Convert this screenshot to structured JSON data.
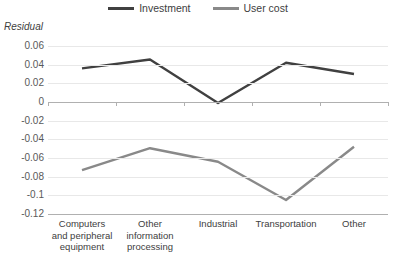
{
  "chart_data": {
    "type": "line",
    "title": "",
    "xlabel": "",
    "ylabel": "Residual",
    "categories": [
      "Computers and peripheral equipment",
      "Other information processing",
      "Industrial",
      "Transportation",
      "Other"
    ],
    "series": [
      {
        "name": "Investment",
        "color": "#404040",
        "values": [
          0.036,
          0.0455,
          -0.001,
          0.042,
          0.03
        ]
      },
      {
        "name": "User cost",
        "color": "#898989",
        "values": [
          -0.073,
          -0.0495,
          -0.064,
          -0.105,
          -0.048
        ]
      }
    ],
    "ylim": [
      -0.12,
      0.06
    ],
    "yticks": [
      0.06,
      0.04,
      0.02,
      0,
      -0.02,
      -0.04,
      -0.06,
      -0.08,
      -0.1,
      -0.12
    ],
    "ytick_labels": [
      "0.06",
      "0.04",
      "0.02",
      "0",
      "-0.02",
      "-0.04",
      "-0.06",
      "-0.08",
      "-0.1",
      "-0.12"
    ],
    "grid": true,
    "legend_position": "top"
  },
  "legend": {
    "items": [
      {
        "label": "Investment",
        "color": "#404040"
      },
      {
        "label": "User cost",
        "color": "#898989"
      }
    ]
  },
  "axis": {
    "y_title": "Residual"
  }
}
